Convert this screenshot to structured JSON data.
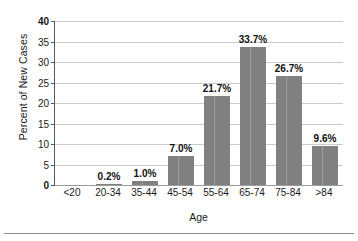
{
  "chart_data": {
    "type": "bar",
    "title": "",
    "subtitle": "",
    "xlabel": "Age",
    "ylabel": "Percent of New Cases",
    "categories": [
      "<20",
      "20-34",
      "35-44",
      "45-54",
      "55-64",
      "65-74",
      "75-84",
      ">84"
    ],
    "values": [
      0,
      0.2,
      1.0,
      7.0,
      21.7,
      33.7,
      26.7,
      9.6
    ],
    "data_labels": [
      "",
      "0.2%",
      "1.0%",
      "7.0%",
      "21.7%",
      "33.7%",
      "26.7%",
      "9.6%"
    ],
    "ylim": [
      0,
      40
    ],
    "ytick_values": [
      0,
      5,
      10,
      15,
      20,
      25,
      30,
      35,
      40
    ],
    "ytick_labels": [
      "0",
      "5",
      "10",
      "15",
      "20",
      "25",
      "30",
      "35",
      "40"
    ],
    "grid": true,
    "grid_axis": "y",
    "legend": false,
    "legend_position": "none",
    "bar_color": "#808080",
    "gridline_color": "#c9cacb",
    "axis_color": "#58595b",
    "background_color": "#ffffff",
    "text_color": "#1a1a1a"
  },
  "axes": {
    "y_title": "Percent of New Cases",
    "x_title": "Age"
  }
}
